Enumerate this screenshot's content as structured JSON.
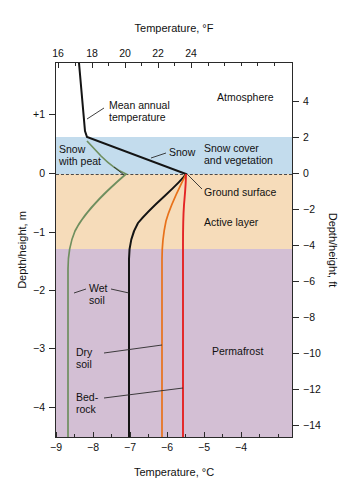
{
  "figure": {
    "background_color": "#ffffff"
  },
  "axes": {
    "top": {
      "title": "Temperature, °F",
      "ticks": [
        {
          "label": "16",
          "x": 58
        },
        {
          "label": "18",
          "x": 92
        },
        {
          "label": "20",
          "x": 125
        },
        {
          "label": "22",
          "x": 158
        },
        {
          "label": "24",
          "x": 191
        }
      ],
      "minor_ticks_x": [
        75,
        108,
        141,
        174,
        208,
        224,
        241,
        257,
        274
      ]
    },
    "bottom": {
      "title": "Temperature, °C",
      "ticks": [
        {
          "label": "−9",
          "x": 56
        },
        {
          "label": "−8",
          "x": 93
        },
        {
          "label": "−7",
          "x": 130
        },
        {
          "label": "−6",
          "x": 167
        },
        {
          "label": "−5",
          "x": 204
        },
        {
          "label": "−4",
          "x": 241
        }
      ],
      "minor_ticks_x": [
        74,
        111,
        148,
        185,
        222,
        259,
        278
      ]
    },
    "left": {
      "title": "Depth/height, m",
      "ticks": [
        {
          "label": "+1",
          "y": 114
        },
        {
          "label": "0",
          "y": 173
        },
        {
          "label": "−1",
          "y": 232
        },
        {
          "label": "−2",
          "y": 290
        },
        {
          "label": "−3",
          "y": 348
        },
        {
          "label": "−4",
          "y": 407
        }
      ]
    },
    "right": {
      "title": "Depth/height, ft",
      "ticks": [
        {
          "label": "4",
          "y": 101
        },
        {
          "label": "2",
          "y": 137
        },
        {
          "label": "0",
          "y": 173
        },
        {
          "label": "−2",
          "y": 209
        },
        {
          "label": "−4",
          "y": 245
        },
        {
          "label": "−6",
          "y": 281
        },
        {
          "label": "−8",
          "y": 317
        },
        {
          "label": "−10",
          "y": 353
        },
        {
          "label": "−12",
          "y": 389
        },
        {
          "label": "−14",
          "y": 425
        }
      ]
    }
  },
  "zones": {
    "atmosphere": {
      "label": "Atmosphere",
      "color": "#ffffff"
    },
    "snow_cover": {
      "label": "Snow cover\nand vegetation",
      "color": "#c3dced"
    },
    "ground_surface": {
      "label": "Ground surface",
      "color": "#4a4a4a"
    },
    "active_layer": {
      "label": "Active layer",
      "color": "#f6dcba"
    },
    "permafrost": {
      "label": "Permafrost",
      "color": "#d3bfd4"
    }
  },
  "annotations": {
    "mean_annual_temperature": "Mean annual\ntemperature",
    "snow": "Snow",
    "snow_with_peat": "Snow\nwith peat",
    "wet_soil": "Wet\nsoil",
    "dry_soil": "Dry\nsoil",
    "bedrock": "Bed-\nrock"
  },
  "chart_data": {
    "type": "line",
    "xlabel": "Temperature, °C",
    "ylabel": "Depth/height, m",
    "xlabel_secondary": "Temperature, °F",
    "ylabel_secondary": "Depth/height, ft",
    "xlim": [
      -9.5,
      -3.0
    ],
    "ylim": [
      -4.4,
      1.35
    ],
    "xlim_secondary_F": [
      14.9,
      26.6
    ],
    "ylim_secondary_ft": [
      -14.6,
      4.4
    ],
    "grid": false,
    "legend": "none (curves labelled inline)",
    "orientation": "x = temperature, y = depth/height (depth increases downward)",
    "bands": [
      {
        "name": "Atmosphere",
        "y_top_m": 1.35,
        "y_bottom_m": 0.63,
        "color": "#ffffff"
      },
      {
        "name": "Snow cover and vegetation",
        "y_top_m": 0.63,
        "y_bottom_m": 0.0,
        "color": "#c3dced"
      },
      {
        "name": "Active layer",
        "y_top_m": 0.0,
        "y_bottom_m": -1.15,
        "color": "#f6dcba"
      },
      {
        "name": "Permafrost",
        "y_top_m": -1.15,
        "y_bottom_m": -4.4,
        "color": "#d3bfd4"
      }
    ],
    "reference_lines": [
      {
        "name": "Ground surface",
        "y_m": 0.0,
        "style": "dashed",
        "color": "#4a4a4a"
      }
    ],
    "series": [
      {
        "name": "Mean annual temperature (air / snow)",
        "color": "#141414",
        "points_temp_c_depth_m": [
          [
            -8.4,
            1.35
          ],
          [
            -8.28,
            1.05
          ],
          [
            -8.18,
            0.8
          ],
          [
            -8.12,
            0.63
          ],
          [
            -7.4,
            0.3
          ],
          [
            -6.6,
            0.02
          ],
          [
            -6.62,
            -0.18
          ],
          [
            -6.72,
            -0.4
          ],
          [
            -6.85,
            -0.62
          ],
          [
            -6.96,
            -0.85
          ],
          [
            -7.01,
            -1.05
          ],
          [
            -7.03,
            -1.25
          ],
          [
            -7.04,
            -2.0
          ],
          [
            -7.04,
            -3.0
          ],
          [
            -7.04,
            -4.4
          ]
        ]
      },
      {
        "name": "Snow with peat",
        "color": "#6f8f5f",
        "points_temp_c_depth_m": [
          [
            -8.12,
            0.55
          ],
          [
            -7.7,
            0.3
          ],
          [
            -7.2,
            0.05
          ],
          [
            -7.05,
            0.0
          ],
          [
            -7.6,
            -0.25
          ],
          [
            -8.1,
            -0.55
          ],
          [
            -8.42,
            -0.9
          ],
          [
            -8.55,
            -1.2
          ],
          [
            -8.6,
            -1.55
          ],
          [
            -8.62,
            -2.3
          ],
          [
            -8.62,
            -3.2
          ],
          [
            -8.62,
            -4.4
          ]
        ]
      },
      {
        "name": "Dry soil",
        "color": "#e8711a",
        "points_temp_c_depth_m": [
          [
            -6.58,
            0.0
          ],
          [
            -6.0,
            -0.18
          ],
          [
            -5.6,
            -0.4
          ],
          [
            -5.35,
            -0.65
          ],
          [
            -5.22,
            -0.9
          ],
          [
            -5.16,
            -1.15
          ],
          [
            -5.14,
            -1.6
          ],
          [
            -5.13,
            -2.5
          ],
          [
            -5.13,
            -3.4
          ],
          [
            -5.13,
            -4.4
          ]
        ]
      },
      {
        "name": "Bedrock",
        "color": "#e42424",
        "points_temp_c_depth_m": [
          [
            -6.55,
            0.0
          ],
          [
            -6.1,
            -0.1
          ],
          [
            -5.1,
            -0.3
          ],
          [
            -4.72,
            -0.55
          ],
          [
            -4.64,
            -0.85
          ],
          [
            -4.62,
            -1.15
          ],
          [
            -4.62,
            -2.0
          ],
          [
            -4.62,
            -3.0
          ],
          [
            -4.62,
            -4.4
          ]
        ]
      }
    ]
  }
}
